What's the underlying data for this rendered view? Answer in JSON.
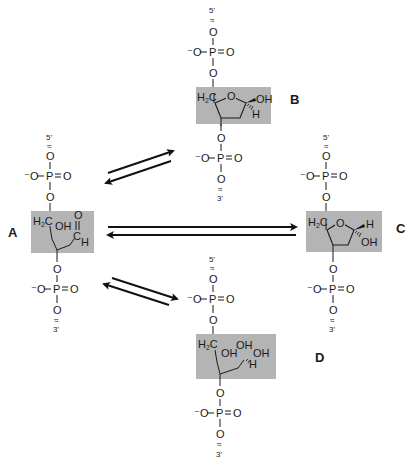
{
  "diagram": {
    "type": "chemical-equilibrium",
    "colors": {
      "box": "#b4b4b4",
      "ink": "#1a1a1a",
      "background": "#ffffff"
    },
    "phosphate": {
      "o_minus": "⁻O",
      "p": "P",
      "o_double": "O",
      "o": "O",
      "break_glyph": "≈"
    },
    "structures": [
      {
        "id": "A",
        "label": "A",
        "form": "open-chain aldehyde",
        "top_end": "5'",
        "bottom_end": "3'",
        "groups": [
          "H₂C",
          "OH",
          "O",
          "C",
          "H"
        ]
      },
      {
        "id": "B",
        "label": "B",
        "form": "cyclic furanose (beta anomer)",
        "top_end": "5'",
        "bottom_end": "3'",
        "groups": [
          "H₂C",
          "O",
          "OH",
          "H"
        ]
      },
      {
        "id": "C",
        "label": "C",
        "form": "cyclic furanose (alpha anomer)",
        "top_end": "5'",
        "bottom_end": "3'",
        "groups": [
          "H₂C",
          "O",
          "H",
          "OH"
        ]
      },
      {
        "id": "D",
        "label": "D",
        "form": "hydrate (gem-diol)",
        "top_end": "5'",
        "bottom_end": "3'",
        "groups": [
          "H₂C",
          "OH",
          "OH",
          "OH",
          "H"
        ]
      }
    ],
    "equilibria": [
      {
        "from": "A",
        "to": "B",
        "type": "reversible"
      },
      {
        "from": "A",
        "to": "C",
        "type": "reversible"
      },
      {
        "from": "A",
        "to": "D",
        "type": "reversible"
      }
    ]
  }
}
